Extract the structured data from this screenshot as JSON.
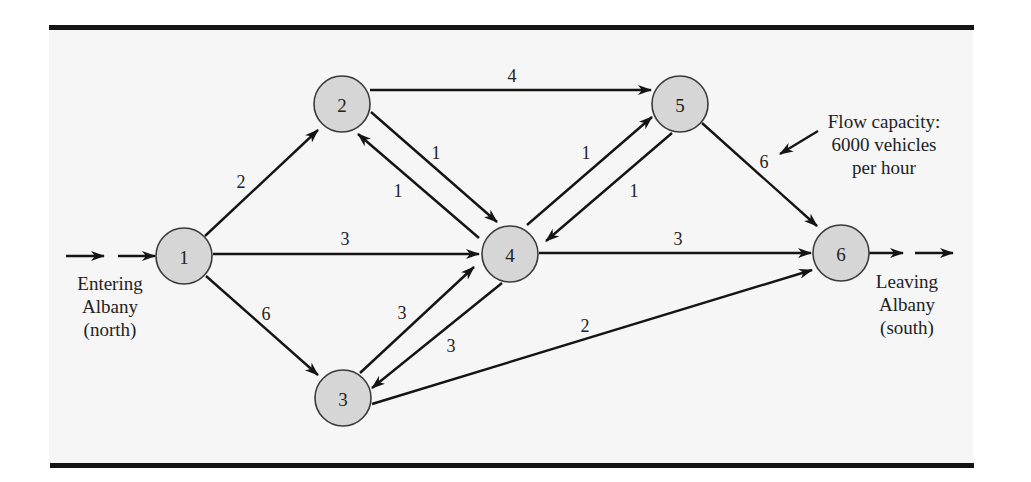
{
  "diagram": {
    "type": "directed network (max-flow)",
    "nodes": [
      {
        "id": "1",
        "label": "1",
        "x": 184,
        "y": 256
      },
      {
        "id": "2",
        "label": "2",
        "x": 342,
        "y": 104
      },
      {
        "id": "3",
        "label": "3",
        "x": 343,
        "y": 398
      },
      {
        "id": "4",
        "label": "4",
        "x": 510,
        "y": 254
      },
      {
        "id": "5",
        "label": "5",
        "x": 680,
        "y": 104
      },
      {
        "id": "6",
        "label": "6",
        "x": 841,
        "y": 253
      }
    ],
    "edges": [
      {
        "from": "1",
        "to": "2",
        "capacity": "2"
      },
      {
        "from": "1",
        "to": "4",
        "capacity": "3"
      },
      {
        "from": "1",
        "to": "3",
        "capacity": "6"
      },
      {
        "from": "2",
        "to": "5",
        "capacity": "4"
      },
      {
        "from": "2",
        "to": "4",
        "capacity": "1"
      },
      {
        "from": "4",
        "to": "2",
        "capacity": "1"
      },
      {
        "from": "3",
        "to": "4",
        "capacity": "3"
      },
      {
        "from": "4",
        "to": "3",
        "capacity": "3"
      },
      {
        "from": "4",
        "to": "5",
        "capacity": "1"
      },
      {
        "from": "5",
        "to": "4",
        "capacity": "1"
      },
      {
        "from": "4",
        "to": "6",
        "capacity": "3"
      },
      {
        "from": "5",
        "to": "6",
        "capacity": "6"
      },
      {
        "from": "3",
        "to": "6",
        "capacity": "2"
      }
    ],
    "source_label": [
      "Entering",
      "Albany",
      "(north)"
    ],
    "sink_label": [
      "Leaving",
      "Albany",
      "(south)"
    ],
    "annotation": [
      "Flow capacity:",
      "6000 vehicles",
      "per hour"
    ]
  }
}
